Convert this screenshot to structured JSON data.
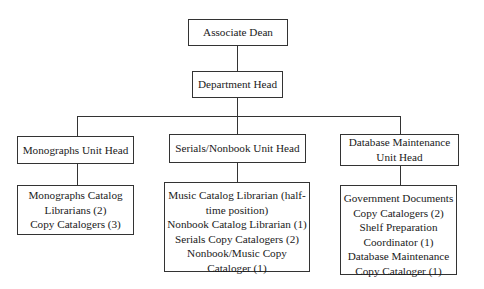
{
  "org_chart": {
    "associate_dean": "Associate Dean",
    "department_head": "Department Head",
    "units": [
      {
        "head": [
          "Monographs Unit Head"
        ],
        "staff": [
          "Monographs Catalog",
          "Librarians (2)",
          "Copy Catalogers (3)"
        ]
      },
      {
        "head": [
          "Serials/Nonbook Unit Head"
        ],
        "staff": [
          "Music Catalog Librarian (half-",
          "time position)",
          "Nonbook Catalog Librarian (1)",
          "Serials Copy Catalogers (2)",
          "Nonbook/Music Copy",
          "Cataloger (1)"
        ]
      },
      {
        "head": [
          "Database Maintenance",
          "Unit Head"
        ],
        "staff": [
          "Government Documents",
          "Copy Catalogers (2)",
          "Shelf Preparation",
          "Coordinator (1)",
          "Database Maintenance",
          "Copy Cataloger (1)"
        ]
      }
    ]
  }
}
